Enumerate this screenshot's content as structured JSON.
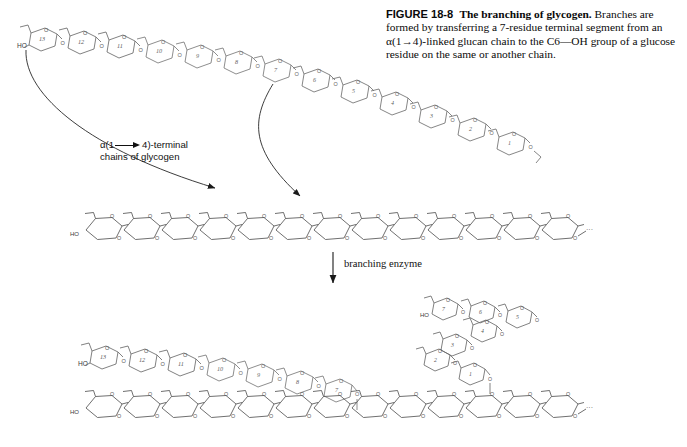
{
  "figure": {
    "label": "FIGURE 18-8",
    "title": "The branching of glycogen.",
    "body": " Branches are formed by transferring a 7-residue terminal segment from an α(1→4)-linked glucan chain to the C6—OH group of a glucose residue on the same or another chain."
  },
  "annotations": {
    "alpha_label_line1_pre": "α(1",
    "alpha_label_line1_post": "4)-terminal",
    "alpha_label_line2": "chains of glycogen",
    "branching_enzyme": "branching enzyme"
  },
  "chemistry": {
    "terminal_hydroxyl": "HO",
    "ring_oxygen": "O",
    "glycosidic_oxygen": "O",
    "chain_continuation": "···",
    "top_chain_numbers": [
      13,
      12,
      11,
      10,
      9,
      8,
      7,
      6,
      5,
      4,
      3,
      2,
      1
    ],
    "bottom_left_chain_numbers": [
      13,
      12,
      11,
      10,
      9,
      8,
      7
    ],
    "transferred_segment_numbers": [
      7,
      6,
      5,
      4,
      3,
      2,
      1
    ],
    "top_backbone_residue_count": 13,
    "bottom_backbone_residue_count": 13
  },
  "colors": {
    "ink": "#3a3a3a",
    "ink_dark": "#111111",
    "text": "#0a0a0a",
    "background": "#ffffff"
  }
}
